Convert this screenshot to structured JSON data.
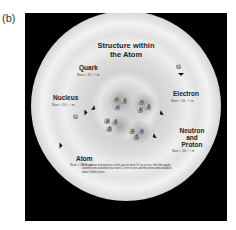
{
  "figure": {
    "panel_label": "(b)",
    "title_line1": "Structure within",
    "title_line2": "the Atom",
    "labels": {
      "quark": {
        "name": "Quark",
        "size": "Size < 10⁻¹⁹ m"
      },
      "electron": {
        "name": "Electron",
        "size": "Size < 10⁻¹⁸ m"
      },
      "nucleus": {
        "name": "Nucleus",
        "size": "Size ≈ 10⁻¹⁴ m"
      },
      "neutron_proton": {
        "name_line1": "Neutron",
        "name_line2": "and",
        "name_line3": "Proton",
        "size": "Size ≈ 10⁻¹⁵ m"
      },
      "atom": {
        "name": "Atom",
        "size": "Size ≈ 10⁻¹⁰ m"
      }
    },
    "electron_symbol": "e⁻",
    "nucleons": [
      {
        "quarks": [
          "u",
          "d",
          "u"
        ]
      },
      {
        "quarks": [
          "u",
          "d",
          "d"
        ]
      },
      {
        "quarks": [
          "u",
          "d",
          "d"
        ]
      },
      {
        "quarks": [
          "u",
          "u",
          "d"
        ]
      }
    ],
    "caption": "If the protons and neutrons in this picture were 10 cm across, then the quarks and electrons would be less than 0.1 mm in size and the entire atom would be about 10 km across."
  }
}
